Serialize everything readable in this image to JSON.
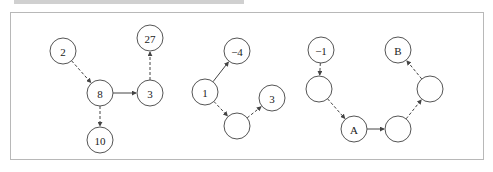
{
  "figure": {
    "panels": [
      {
        "id": "panel-1",
        "nodes": [
          {
            "id": "n2",
            "label": "2",
            "x": 63,
            "y": 51
          },
          {
            "id": "n8",
            "label": "8",
            "x": 100,
            "y": 93
          },
          {
            "id": "n3",
            "label": "3",
            "x": 150,
            "y": 93
          },
          {
            "id": "n27",
            "label": "27",
            "x": 150,
            "y": 38
          },
          {
            "id": "n10",
            "label": "10",
            "x": 100,
            "y": 140
          }
        ],
        "edges": [
          {
            "from": "n2",
            "to": "n8",
            "style": "dashed"
          },
          {
            "from": "n8",
            "to": "n3",
            "style": "solid"
          },
          {
            "from": "n3",
            "to": "n27",
            "style": "dashed"
          },
          {
            "from": "n8",
            "to": "n10",
            "style": "dashed"
          }
        ]
      },
      {
        "id": "panel-2",
        "nodes": [
          {
            "id": "m-4",
            "label": "−4",
            "x": 237,
            "y": 51
          },
          {
            "id": "m1",
            "label": "1",
            "x": 205,
            "y": 92
          },
          {
            "id": "m3",
            "label": "3",
            "x": 272,
            "y": 98
          },
          {
            "id": "me",
            "label": "",
            "x": 237,
            "y": 126
          }
        ],
        "edges": [
          {
            "from": "m1",
            "to": "m-4",
            "style": "solid"
          },
          {
            "from": "m1",
            "to": "me",
            "style": "dashed"
          },
          {
            "from": "me",
            "to": "m3",
            "style": "dashed"
          }
        ]
      },
      {
        "id": "panel-3",
        "nodes": [
          {
            "id": "r-1",
            "label": "−1",
            "x": 321,
            "y": 50
          },
          {
            "id": "rB",
            "label": "B",
            "x": 398,
            "y": 50
          },
          {
            "id": "rL",
            "label": "",
            "x": 319,
            "y": 89
          },
          {
            "id": "rR",
            "label": "",
            "x": 430,
            "y": 89
          },
          {
            "id": "rA",
            "label": "A",
            "x": 354,
            "y": 129
          },
          {
            "id": "rBot",
            "label": "",
            "x": 398,
            "y": 129
          }
        ],
        "edges": [
          {
            "from": "r-1",
            "to": "rL",
            "style": "dashed"
          },
          {
            "from": "rL",
            "to": "rA",
            "style": "dashed"
          },
          {
            "from": "rA",
            "to": "rBot",
            "style": "solid"
          },
          {
            "from": "rBot",
            "to": "rR",
            "style": "dashed"
          },
          {
            "from": "rR",
            "to": "rB",
            "style": "dashed"
          }
        ]
      }
    ],
    "node_radius": 13,
    "colors": {
      "stroke": "#555555",
      "edge": "#444444",
      "frame": "#b8b8b8"
    }
  }
}
